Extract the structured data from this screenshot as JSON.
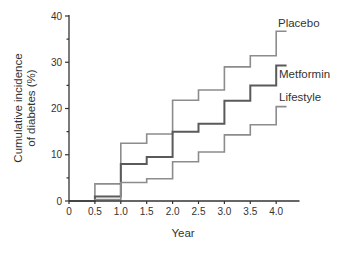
{
  "chart_data": {
    "type": "line",
    "step": true,
    "title": "",
    "xlabel": "Year",
    "ylabel": "Cumulative incidence of diabetes (%)",
    "ylabel_lines": [
      "Cumulative incidence",
      "of diabetes (%)"
    ],
    "xlim": [
      0,
      4.25
    ],
    "ylim": [
      0,
      40
    ],
    "x_ticks": [
      "0",
      "0.5",
      "1.0",
      "1.5",
      "2.0",
      "2.5",
      "3.0",
      "3.5",
      "4.0"
    ],
    "x_tick_values": [
      0,
      0.5,
      1.0,
      1.5,
      2.0,
      2.5,
      3.0,
      3.5,
      4.0
    ],
    "y_ticks": [
      "0",
      "10",
      "20",
      "30",
      "40"
    ],
    "y_tick_values": [
      0,
      10,
      20,
      30,
      40
    ],
    "y_minor_ticks": [
      5,
      15,
      25,
      35
    ],
    "grid": false,
    "legend_position": "inline-right",
    "x": [
      0,
      0.5,
      1.0,
      1.5,
      2.0,
      2.5,
      3.0,
      3.5,
      4.0
    ],
    "x_end": 4.2,
    "series": [
      {
        "name": "Placebo",
        "color": "#8c8c8c",
        "values": [
          0,
          3.7,
          12.5,
          14.5,
          21.8,
          24.0,
          29.0,
          31.4,
          36.7
        ]
      },
      {
        "name": "Metformin",
        "color": "#5a5a5a",
        "values": [
          0,
          1.0,
          8.0,
          9.5,
          15.0,
          16.7,
          21.7,
          25.0,
          29.3
        ]
      },
      {
        "name": "Lifestyle",
        "color": "#8c8c8c",
        "values": [
          0,
          0.3,
          4.0,
          4.8,
          8.5,
          10.6,
          14.3,
          16.5,
          20.4
        ]
      }
    ]
  }
}
